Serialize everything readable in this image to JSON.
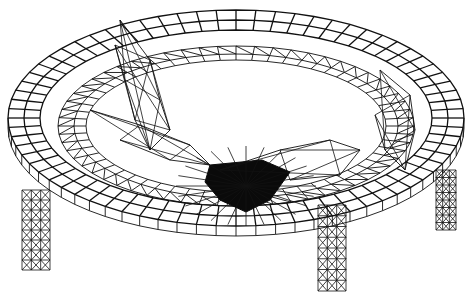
{
  "figure": {
    "type": "wireframe-mesh",
    "colors": {
      "line": "#111111",
      "background": "#ffffff"
    },
    "parts": [
      "outer-ring",
      "inner-ring",
      "support-legs",
      "central-hub",
      "radial-arms"
    ]
  }
}
